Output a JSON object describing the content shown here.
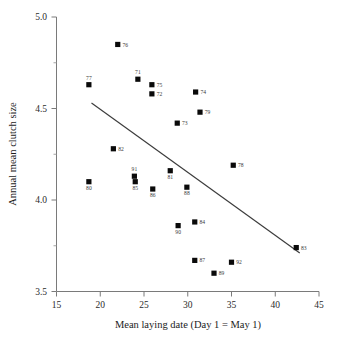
{
  "chart_data": {
    "type": "scatter",
    "title": "",
    "xlabel": "Mean laying date (Day 1 = May 1)",
    "ylabel": "Annual mean clutch size",
    "xlim": [
      15,
      45
    ],
    "ylim": [
      3.5,
      5.0
    ],
    "xticks": [
      15,
      20,
      25,
      30,
      35,
      40,
      45
    ],
    "yticks": [
      "3.5",
      "4.0",
      "4.5",
      "5.0"
    ],
    "y_minor_ticks": [
      3.75,
      4.25,
      4.75
    ],
    "grid": false,
    "legend": "none",
    "point_label_note": "two-digit year labels beside each marker",
    "points": [
      {
        "label": "77",
        "x": 18.7,
        "y": 4.63,
        "label_pos": "above"
      },
      {
        "label": "80",
        "x": 18.7,
        "y": 4.1,
        "label_pos": "below"
      },
      {
        "label": "82",
        "x": 21.5,
        "y": 4.28,
        "label_pos": "right"
      },
      {
        "label": "76",
        "x": 22.0,
        "y": 4.85,
        "label_pos": "right"
      },
      {
        "label": "91",
        "x": 23.9,
        "y": 4.13,
        "label_pos": "above"
      },
      {
        "label": "85",
        "x": 24.0,
        "y": 4.1,
        "label_pos": "below"
      },
      {
        "label": "71",
        "x": 24.3,
        "y": 4.66,
        "label_pos": "above"
      },
      {
        "label": "75",
        "x": 25.9,
        "y": 4.63,
        "label_pos": "right"
      },
      {
        "label": "72",
        "x": 25.9,
        "y": 4.58,
        "label_pos": "right"
      },
      {
        "label": "86",
        "x": 26.0,
        "y": 4.06,
        "label_pos": "below"
      },
      {
        "label": "81",
        "x": 28.0,
        "y": 4.16,
        "label_pos": "below"
      },
      {
        "label": "73",
        "x": 28.8,
        "y": 4.42,
        "label_pos": "right"
      },
      {
        "label": "90",
        "x": 28.9,
        "y": 3.86,
        "label_pos": "below"
      },
      {
        "label": "88",
        "x": 29.9,
        "y": 4.07,
        "label_pos": "below"
      },
      {
        "label": "74",
        "x": 30.9,
        "y": 4.59,
        "label_pos": "right"
      },
      {
        "label": "84",
        "x": 30.8,
        "y": 3.88,
        "label_pos": "right"
      },
      {
        "label": "87",
        "x": 30.8,
        "y": 3.67,
        "label_pos": "right"
      },
      {
        "label": "79",
        "x": 31.4,
        "y": 4.48,
        "label_pos": "right"
      },
      {
        "label": "89",
        "x": 33.0,
        "y": 3.6,
        "label_pos": "right"
      },
      {
        "label": "92",
        "x": 35.0,
        "y": 3.66,
        "label_pos": "right"
      },
      {
        "label": "78",
        "x": 35.2,
        "y": 4.19,
        "label_pos": "right"
      },
      {
        "label": "83",
        "x": 42.4,
        "y": 3.74,
        "label_pos": "right"
      }
    ],
    "trend_line": {
      "type": "linear-fit",
      "x_start": 19.0,
      "y_start": 4.53,
      "x_end": 42.8,
      "y_end": 3.71
    }
  },
  "colors": {
    "marker": "#0a0a0a",
    "axis": "#7a7a7a",
    "line": "#3b3b3b",
    "background": "#ffffff"
  }
}
